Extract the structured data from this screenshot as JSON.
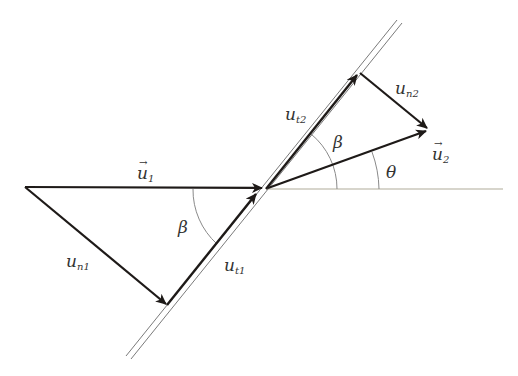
{
  "diagram": {
    "labels": {
      "u1": {
        "base": "u",
        "sub": "1",
        "vector": true
      },
      "u2": {
        "base": "u",
        "sub": "2",
        "vector": true
      },
      "un1": {
        "base": "u",
        "sub": "n1"
      },
      "ut1": {
        "base": "u",
        "sub": "t1"
      },
      "ut2": {
        "base": "u",
        "sub": "t2"
      },
      "un2": {
        "base": "u",
        "sub": "n2"
      },
      "beta_lower": "β",
      "beta_upper": "β",
      "theta": "θ"
    },
    "colors": {
      "vector": "#1e1a18",
      "wall": "#7a7a7a",
      "arc": "#8a8a8a",
      "baseline": "#b0ab9a",
      "text": "#333333"
    }
  }
}
